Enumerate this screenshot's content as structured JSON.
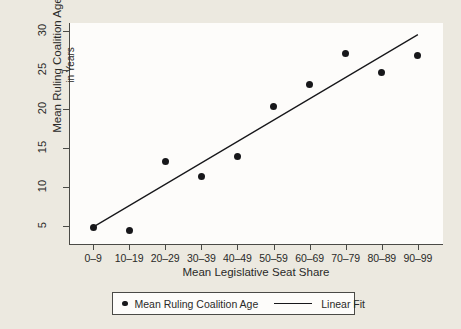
{
  "chart_data": {
    "type": "scatter",
    "title": "",
    "xlabel": "Mean Legislative Seat Share",
    "ylabel_line1": "Mean Ruling Coalition Age",
    "ylabel_line2": "in Years",
    "categories": [
      "0–9",
      "10–19",
      "20–29",
      "30–39",
      "40–49",
      "50–59",
      "60–69",
      "70–79",
      "80–89",
      "90–99"
    ],
    "values": [
      4.8,
      4.4,
      13.2,
      11.3,
      13.9,
      20.3,
      23.1,
      27.1,
      24.7,
      26.8
    ],
    "ylim": [
      2.5,
      31
    ],
    "yticks": [
      5,
      10,
      15,
      20,
      25,
      30
    ],
    "ytick_labels": [
      "5",
      "10",
      "15",
      "20",
      "25",
      "30"
    ],
    "grid": false,
    "series": [
      {
        "name": "Mean Ruling Coalition Age",
        "kind": "scatter",
        "marker": "filled-circle",
        "color": "#17171a",
        "values": [
          4.8,
          4.4,
          13.2,
          11.3,
          13.9,
          20.3,
          23.1,
          27.1,
          24.7,
          26.8
        ]
      },
      {
        "name": "Linear Fit",
        "kind": "line",
        "color": "#17171a",
        "endpoints": [
          {
            "x_index": 0,
            "y": 4.8
          },
          {
            "x_index": 9,
            "y": 29.5
          }
        ]
      }
    ],
    "legend": {
      "position": "bottom",
      "entries": [
        {
          "marker": "filled-circle",
          "label": "Mean Ruling Coalition Age"
        },
        {
          "marker": "line",
          "label": "Linear Fit"
        }
      ]
    },
    "colors": {
      "background": "#ece9e0",
      "plot_background": "#fdfcfa",
      "axis": "#4a4a46",
      "mark": "#17171a"
    }
  }
}
